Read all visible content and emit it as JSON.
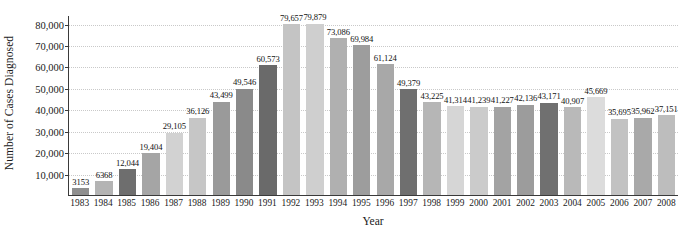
{
  "chart_data": {
    "type": "bar",
    "title": "",
    "xlabel": "Year",
    "ylabel": "Number of Cases Diagnosed",
    "categories": [
      "1983",
      "1984",
      "1985",
      "1986",
      "1987",
      "1988",
      "1989",
      "1990",
      "1991",
      "1992",
      "1993",
      "1994",
      "1995",
      "1996",
      "1997",
      "1998",
      "1999",
      "2000",
      "2001",
      "2002",
      "2003",
      "2004",
      "2005",
      "2006",
      "2007",
      "2008"
    ],
    "values": [
      3153,
      6368,
      12044,
      19404,
      29105,
      36126,
      43499,
      49546,
      60573,
      79657,
      79879,
      73086,
      69984,
      61124,
      49379,
      43225,
      41314,
      41239,
      41227,
      42136,
      43171,
      40907,
      45669,
      35695,
      35962,
      37151
    ],
    "value_labels": [
      "3153",
      "6368",
      "12,044",
      "19,404",
      "29,105",
      "36,126",
      "43,499",
      "49,546",
      "60,573",
      "79,657",
      "79,879",
      "73,086",
      "69,984",
      "61,124",
      "49,379",
      "43,225",
      "41,314",
      "41,239",
      "41,227",
      "42,136",
      "43,171",
      "40,907",
      "45,669",
      "35,695",
      "35,962",
      "37,151"
    ],
    "bar_colors": [
      "#8f8f8f",
      "#b4b4b4",
      "#6e6e6e",
      "#a5a5a5",
      "#d2d2d2",
      "#c6c6c6",
      "#9a9a9a",
      "#8a8a8a",
      "#6a6a6a",
      "#c4c4c4",
      "#cfcfcf",
      "#b0b0b0",
      "#9d9d9d",
      "#a8a8a8",
      "#6f6f6f",
      "#b6b6b6",
      "#d6d6d6",
      "#cbcbcb",
      "#a3a3a3",
      "#9c9c9c",
      "#707070",
      "#b9b9b9",
      "#dcdcdc",
      "#c2c2c2",
      "#a9a9a9",
      "#bdbdbd"
    ],
    "ylim": [
      0,
      84000
    ],
    "yticks": [
      10000,
      20000,
      30000,
      40000,
      50000,
      60000,
      70000,
      80000
    ],
    "ytick_labels": [
      "10,000",
      "20,000",
      "30,000",
      "40,000",
      "50,000",
      "60,000",
      "70,000",
      "80,000"
    ],
    "grid": true,
    "legend": "none",
    "axis_color": "#3a3a3a",
    "gridline_color": "#c9c9c9",
    "background": "#ffffff"
  }
}
